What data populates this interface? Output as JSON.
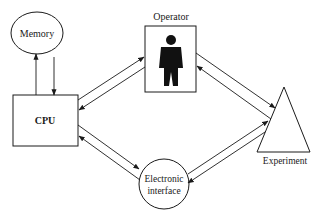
{
  "diagram": {
    "nodes": {
      "memory": {
        "label": "Memory",
        "shape": "ellipse"
      },
      "cpu": {
        "label": "CPU",
        "shape": "rectangle"
      },
      "operator": {
        "label": "Operator",
        "shape": "rectangle-with-person"
      },
      "experiment": {
        "label": "Experiment",
        "shape": "triangle"
      },
      "interface": {
        "label_line1": "Electronic",
        "label_line2": "interface",
        "shape": "circle"
      }
    },
    "edges": [
      {
        "from": "cpu",
        "to": "memory",
        "bidirectional": true
      },
      {
        "from": "cpu",
        "to": "operator",
        "bidirectional": true
      },
      {
        "from": "operator",
        "to": "experiment",
        "bidirectional": true
      },
      {
        "from": "cpu",
        "to": "interface",
        "bidirectional": true
      },
      {
        "from": "interface",
        "to": "experiment",
        "bidirectional": true
      }
    ],
    "colors": {
      "stroke": "#1a1a1a",
      "background": "#ffffff"
    }
  }
}
